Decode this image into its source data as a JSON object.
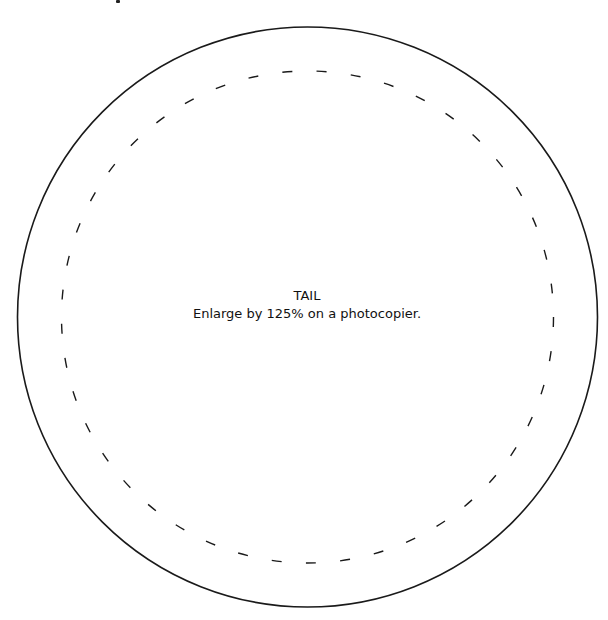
{
  "template": {
    "title": "TAIL",
    "instruction": "Enlarge by 125% on a photocopier.",
    "outer_circle": {
      "cx": 307.5,
      "cy": 317,
      "r": 290,
      "stroke": "#1a1a1a",
      "style": "solid"
    },
    "cut_line": {
      "cx": 307.5,
      "cy": 317,
      "r": 246,
      "stroke": "#1a1a1a",
      "style": "dashed"
    }
  }
}
